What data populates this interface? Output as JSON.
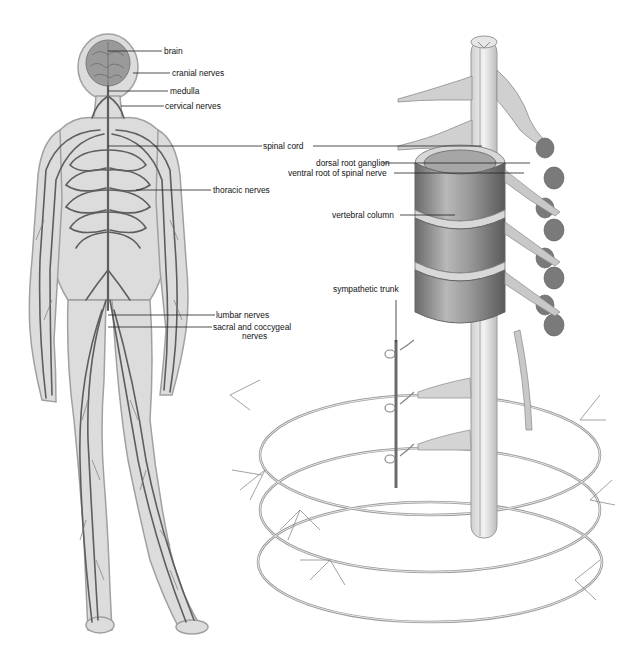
{
  "caption": "",
  "figure": {
    "left_panel": {
      "title": "human nervous system",
      "labels": [
        {
          "id": "brain",
          "text": "brain"
        },
        {
          "id": "cranial",
          "text": "cranial nerves"
        },
        {
          "id": "medulla",
          "text": "medulla"
        },
        {
          "id": "cervical",
          "text": "cervical nerves"
        },
        {
          "id": "spinal_cord",
          "text": "spinal cord"
        },
        {
          "id": "thoracic",
          "text": "thoracic nerves"
        },
        {
          "id": "lumbar",
          "text": "lumbar nerves"
        },
        {
          "id": "sacral",
          "text": "sacral and coccygeal"
        },
        {
          "id": "sacral2",
          "text": "nerves"
        }
      ]
    },
    "right_panel": {
      "title": "spinal column detail",
      "labels": [
        {
          "id": "dorsal",
          "text": "dorsal root ganglion"
        },
        {
          "id": "ventral",
          "text": "ventral root of spinal nerve"
        },
        {
          "id": "vertebral",
          "text": "vertebral column"
        },
        {
          "id": "sympathetic",
          "text": "sympathetic trunk"
        }
      ]
    }
  },
  "colors": {
    "body_fill": "#d9d9d9",
    "body_outline": "#a8a8a8",
    "nerve": "#5e5e5e",
    "leader": "#222222"
  }
}
